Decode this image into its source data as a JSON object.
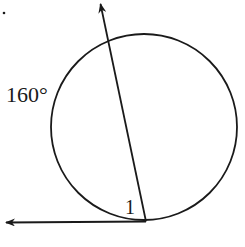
{
  "diagram": {
    "type": "circle-tangent-secant",
    "labels": {
      "arc": "160°",
      "angle": "1"
    },
    "colors": {
      "stroke": "#1a1a1a",
      "background": "#ffffff"
    },
    "circle": {
      "cx": 144,
      "cy": 127,
      "r": 93
    },
    "tangent_point": [
      146,
      221
    ],
    "tangent_arrow_tip": [
      4,
      222
    ],
    "chord_arrow_tip": [
      100,
      2
    ]
  }
}
